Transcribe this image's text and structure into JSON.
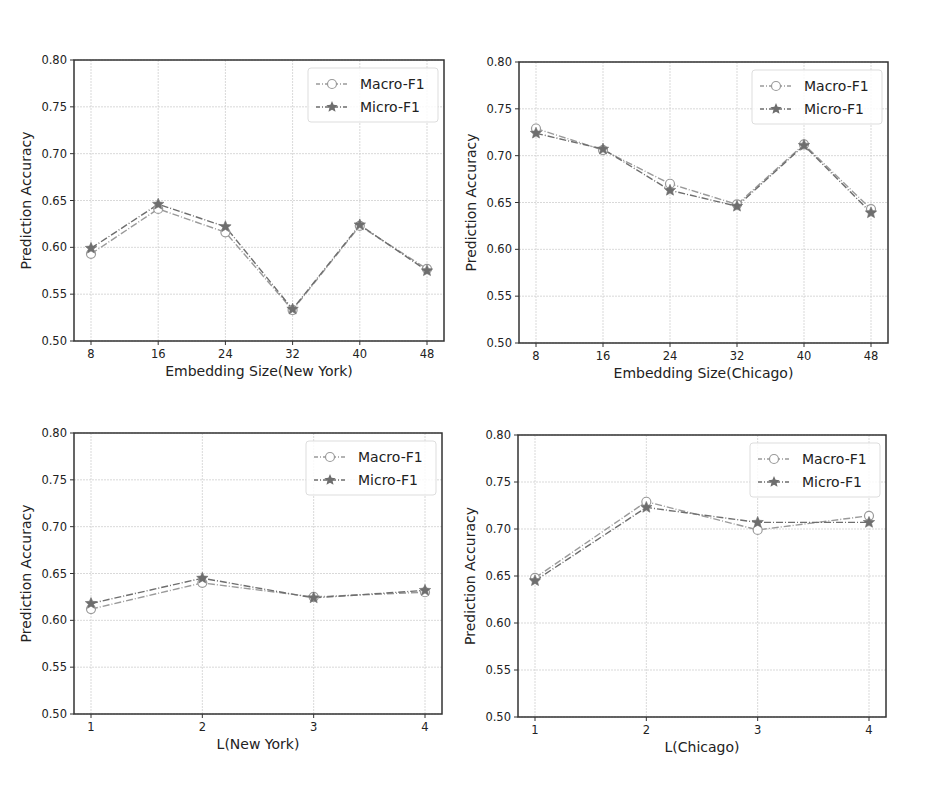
{
  "chart_data": [
    {
      "type": "line",
      "title": "",
      "xlabel": "Embedding Size(New York)",
      "ylabel": "Prediction Accuracy",
      "x": [
        8,
        16,
        24,
        32,
        40,
        48
      ],
      "xticks": [
        "8",
        "16",
        "24",
        "32",
        "40",
        "48"
      ],
      "ylim": [
        0.5,
        0.8
      ],
      "yticks": [
        "0.50",
        "0.55",
        "0.60",
        "0.65",
        "0.70",
        "0.75",
        "0.80"
      ],
      "grid": true,
      "legend_position": "upper right",
      "series": [
        {
          "name": "Macro-F1",
          "marker": "circle",
          "values": [
            0.593,
            0.641,
            0.616,
            0.533,
            0.623,
            0.577
          ]
        },
        {
          "name": "Micro-F1",
          "marker": "star",
          "values": [
            0.599,
            0.646,
            0.622,
            0.534,
            0.624,
            0.575
          ]
        }
      ]
    },
    {
      "type": "line",
      "title": "",
      "xlabel": "Embedding Size(Chicago)",
      "ylabel": "Prediction Accuracy",
      "x": [
        8,
        16,
        24,
        32,
        40,
        48
      ],
      "xticks": [
        "8",
        "16",
        "24",
        "32",
        "40",
        "48"
      ],
      "ylim": [
        0.5,
        0.8
      ],
      "yticks": [
        "0.50",
        "0.55",
        "0.60",
        "0.65",
        "0.70",
        "0.75",
        "0.80"
      ],
      "grid": true,
      "legend_position": "upper right",
      "series": [
        {
          "name": "Macro-F1",
          "marker": "circle",
          "values": [
            0.729,
            0.706,
            0.67,
            0.648,
            0.712,
            0.643
          ]
        },
        {
          "name": "Micro-F1",
          "marker": "star",
          "values": [
            0.724,
            0.707,
            0.663,
            0.646,
            0.711,
            0.639
          ]
        }
      ]
    },
    {
      "type": "line",
      "title": "",
      "xlabel": "L(New York)",
      "ylabel": "Prediction Accuracy",
      "x": [
        1,
        2,
        3,
        4
      ],
      "xticks": [
        "1",
        "2",
        "3",
        "4"
      ],
      "ylim": [
        0.5,
        0.8
      ],
      "yticks": [
        "0.50",
        "0.55",
        "0.60",
        "0.65",
        "0.70",
        "0.75",
        "0.80"
      ],
      "grid": true,
      "legend_position": "upper right",
      "series": [
        {
          "name": "Macro-F1",
          "marker": "circle",
          "values": [
            0.612,
            0.64,
            0.625,
            0.63
          ]
        },
        {
          "name": "Micro-F1",
          "marker": "star",
          "values": [
            0.618,
            0.645,
            0.624,
            0.632
          ]
        }
      ]
    },
    {
      "type": "line",
      "title": "",
      "xlabel": "L(Chicago)",
      "ylabel": "Prediction Accuracy",
      "x": [
        1,
        2,
        3,
        4
      ],
      "xticks": [
        "1",
        "2",
        "3",
        "4"
      ],
      "ylim": [
        0.5,
        0.8
      ],
      "yticks": [
        "0.50",
        "0.55",
        "0.60",
        "0.65",
        "0.70",
        "0.75",
        "0.80"
      ],
      "grid": true,
      "legend_position": "upper right",
      "series": [
        {
          "name": "Macro-F1",
          "marker": "circle",
          "values": [
            0.648,
            0.729,
            0.699,
            0.714
          ]
        },
        {
          "name": "Micro-F1",
          "marker": "star",
          "values": [
            0.645,
            0.723,
            0.707,
            0.707
          ]
        }
      ]
    }
  ],
  "style": {
    "macro_color": "#9a9a9a",
    "micro_color": "#6e6e6e",
    "grid_color": "#cfcfcf",
    "axis_color": "#333333"
  }
}
